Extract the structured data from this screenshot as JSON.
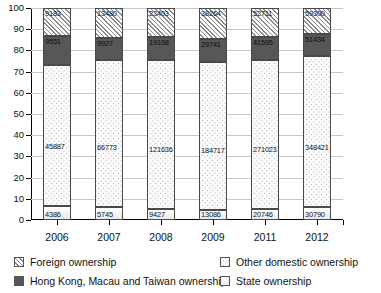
{
  "chart_data": {
    "type": "bar",
    "subtype": "stacked-percentage",
    "title": "",
    "xlabel": "",
    "ylabel": "",
    "ylim": [
      0,
      100
    ],
    "yticks": [
      0,
      10,
      20,
      30,
      40,
      50,
      60,
      70,
      80,
      90,
      100
    ],
    "grid": true,
    "legend_position": "bottom",
    "categories": [
      "2006",
      "2007",
      "2008",
      "2009",
      "2011",
      "2012"
    ],
    "series": [
      {
        "name": "State ownership",
        "pattern": "light",
        "values": [
          4386,
          5745,
          9427,
          13086,
          20746,
          30790
        ],
        "percent": [
          6.4,
          5.5,
          4.9,
          4.9,
          5.7,
          6.3
        ]
      },
      {
        "name": "Other domestic ownership",
        "pattern": "dotted",
        "values": [
          45887,
          66773,
          121636,
          184717,
          271023,
          348421
        ],
        "percent": [
          66.5,
          63.9,
          63.8,
          69.0,
          69.0,
          71.1
        ]
      },
      {
        "name": "Hong Kong, Macau and Taiwan ownership",
        "pattern": "dark-solid",
        "values": [
          9551,
          9927,
          19108,
          29741,
          41595,
          51434
        ],
        "percent": [
          13.8,
          10.5,
          10.0,
          11.1,
          10.6,
          10.5
        ]
      },
      {
        "name": "Foreign ownership",
        "pattern": "diagonal-hatch",
        "values": [
          9183,
          13480,
          23403,
          38264,
          52711,
          59300
        ],
        "percent": [
          13.3,
          12.9,
          12.3,
          14.3,
          13.4,
          12.1
        ]
      }
    ],
    "totals": [
      69007,
      95925,
      173574,
      265808,
      386075,
      489945
    ]
  },
  "axis": {
    "y_tick_labels": [
      "100",
      "90",
      "80",
      "70",
      "60",
      "50",
      "40",
      "30",
      "20",
      "10",
      "0"
    ],
    "x_tick_labels": [
      "2006",
      "2007",
      "2008",
      "2009",
      "2011",
      "2012"
    ]
  },
  "legend": {
    "items": [
      {
        "label": "Foreign ownership",
        "swatch": "diagonal-hatch"
      },
      {
        "label": "Other domestic ownership",
        "swatch": "dotted"
      },
      {
        "label": "Hong Kong, Macau and Taiwan ownership",
        "swatch": "dark-solid"
      },
      {
        "label": "State ownership",
        "swatch": "light"
      }
    ]
  },
  "bars": [
    {
      "year": "2006",
      "segments": [
        {
          "key": "foreign",
          "label": "9183",
          "pct": 13.3
        },
        {
          "key": "hkmt",
          "label": "9551",
          "pct": 13.8
        },
        {
          "key": "other",
          "label": "45887",
          "pct": 66.5
        },
        {
          "key": "state",
          "label": "4386",
          "pct": 6.4
        }
      ]
    },
    {
      "year": "2007",
      "segments": [
        {
          "key": "foreign",
          "label": "13480",
          "pct": 14.1
        },
        {
          "key": "hkmt",
          "label": "9927",
          "pct": 10.3
        },
        {
          "key": "other",
          "label": "66773",
          "pct": 69.6
        },
        {
          "key": "state",
          "label": "5745",
          "pct": 6.0
        }
      ]
    },
    {
      "year": "2008",
      "segments": [
        {
          "key": "foreign",
          "label": "23403",
          "pct": 13.5
        },
        {
          "key": "hkmt",
          "label": "19108",
          "pct": 11.0
        },
        {
          "key": "other",
          "label": "121636",
          "pct": 70.1
        },
        {
          "key": "state",
          "label": "9427",
          "pct": 5.4
        }
      ]
    },
    {
      "year": "2009",
      "segments": [
        {
          "key": "foreign",
          "label": "38264",
          "pct": 14.4
        },
        {
          "key": "hkmt",
          "label": "29741",
          "pct": 11.2
        },
        {
          "key": "other",
          "label": "184717",
          "pct": 69.5
        },
        {
          "key": "state",
          "label": "13086",
          "pct": 4.9
        }
      ]
    },
    {
      "year": "2011",
      "segments": [
        {
          "key": "foreign",
          "label": "52711",
          "pct": 13.7
        },
        {
          "key": "hkmt",
          "label": "41595",
          "pct": 10.8
        },
        {
          "key": "other",
          "label": "271023",
          "pct": 70.2
        },
        {
          "key": "state",
          "label": "20746",
          "pct": 5.3
        }
      ]
    },
    {
      "year": "2012",
      "segments": [
        {
          "key": "foreign",
          "label": "59300",
          "pct": 12.1
        },
        {
          "key": "hkmt",
          "label": "51434",
          "pct": 10.5
        },
        {
          "key": "other",
          "label": "348421",
          "pct": 71.1
        },
        {
          "key": "state",
          "label": "30790",
          "pct": 6.3
        }
      ]
    }
  ],
  "colors": {
    "axis": "#000000",
    "grid": "#c8c8c8",
    "dark_segment": "#575757",
    "hatch": "#8d8d8d",
    "dot": "#b7b7b7",
    "text": "#111111"
  }
}
